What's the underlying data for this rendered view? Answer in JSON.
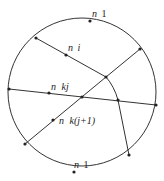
{
  "diagram": {
    "type": "circle-partition",
    "stroke_color": "#333333",
    "background": "#ffffff",
    "circle": {
      "cx": 82,
      "cy": 92,
      "r": 74
    },
    "nodes": {
      "top_n1": {
        "x": 90,
        "y": 21
      },
      "upper_left_boundary": {
        "x": 36,
        "y": 38
      },
      "ni_point": {
        "x": 66,
        "y": 55
      },
      "upper_junction": {
        "x": 106,
        "y": 77
      },
      "upper_right_boundary": {
        "x": 140,
        "y": 49
      },
      "left_boundary": {
        "x": 9,
        "y": 89
      },
      "nkj_point": {
        "x": 49,
        "y": 93
      },
      "center_junction": {
        "x": 82,
        "y": 97
      },
      "right_junction": {
        "x": 118,
        "y": 100
      },
      "right_boundary": {
        "x": 156,
        "y": 105
      },
      "lower_left_boundary": {
        "x": 25,
        "y": 144
      },
      "nkj1_point": {
        "x": 53,
        "y": 120
      },
      "lower_right_boundary": {
        "x": 129,
        "y": 155
      },
      "bottom_n1": {
        "x": 74,
        "y": 172
      }
    },
    "edges": [
      [
        "upper_left_boundary",
        "upper_junction"
      ],
      [
        "upper_junction",
        "upper_right_boundary"
      ],
      [
        "left_boundary",
        "right_boundary"
      ],
      [
        "lower_left_boundary",
        "upper_junction"
      ],
      [
        "upper_junction",
        "right_junction"
      ],
      [
        "right_junction",
        "lower_right_boundary"
      ]
    ],
    "labels": {
      "top_n1": {
        "n": "n",
        "sub": "1"
      },
      "ni": {
        "n": "n",
        "sub": "i"
      },
      "nkj": {
        "n": "n",
        "sub": "kj"
      },
      "nkj1": {
        "n": "n",
        "sub": "k(j+1)"
      },
      "bottom_n1": {
        "n": "n",
        "sub": "1"
      }
    }
  }
}
